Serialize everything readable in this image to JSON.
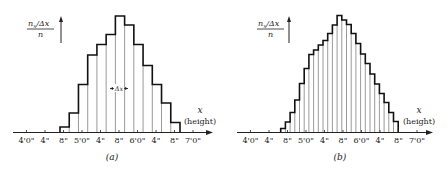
{
  "chart_data": [
    {
      "type": "bar",
      "panel": "(a)",
      "title": "",
      "caption": "(a)",
      "xlabel": "x (height)",
      "ylabel": "n_x/Δx / n",
      "annotation": "Δx",
      "bin_width_inches": 2,
      "categories": [
        "4'8\"",
        "4'10\"",
        "5'0\"",
        "5'2\"",
        "5'4\"",
        "5'6\"",
        "5'8\"",
        "5'10\"",
        "6'0\"",
        "6'2\"",
        "6'4\"",
        "6'6\"",
        "6'8\""
      ],
      "values": [
        5.5,
        19.5,
        48,
        77.5,
        88,
        98,
        116.5,
        107.5,
        88,
        67,
        48,
        29.5,
        10
      ],
      "tick_labels": [
        "4'0\"",
        "4\"",
        "8\"",
        "5'0\"",
        "4\"",
        "8\"",
        "6'0\"",
        "4\"",
        "8\"",
        "7'0\""
      ],
      "grid": false
    },
    {
      "type": "bar",
      "panel": "(b)",
      "title": "",
      "caption": "(b)",
      "xlabel": "x (height)",
      "ylabel": "n_x/Δx / n",
      "bin_width_inches": 1,
      "categories": [
        "4'7\"",
        "4'8\"",
        "4'9\"",
        "4'10\"",
        "4'11\"",
        "5'0\"",
        "5'1\"",
        "5'2\"",
        "5'3\"",
        "5'4\"",
        "5'5\"",
        "5'6\"",
        "5'7\"",
        "5'8\"",
        "5'9\"",
        "5'10\"",
        "5'11\"",
        "6'0\"",
        "6'1\"",
        "6'2\"",
        "6'3\"",
        "6'4\"",
        "6'5\"",
        "6'6\"",
        "6'7\""
      ],
      "values": [
        4,
        10.5,
        20,
        32.5,
        49,
        64,
        78,
        82.5,
        87.5,
        92,
        99,
        107.5,
        117,
        112.5,
        108,
        99,
        89,
        78.5,
        69,
        58.5,
        48.5,
        39,
        30,
        20,
        11
      ],
      "tick_labels": [
        "4'0\"",
        "4\"",
        "8\"",
        "5'0\"",
        "4\"",
        "8\"",
        "6'0\"",
        "4\"",
        "8\"",
        "7'0\""
      ],
      "grid": false
    }
  ],
  "panels": [
    {
      "caption": "(a)",
      "y_num": "n",
      "y_num_sub": "x",
      "y_num_rest": "/Δx",
      "y_den": "n",
      "x_var": "x",
      "x_desc": "(height)",
      "delta": "Δx"
    },
    {
      "caption": "(b)",
      "y_num": "n",
      "y_num_sub": "x",
      "y_num_rest": "/Δx",
      "y_den": "n",
      "x_var": "x",
      "x_desc": "(height)"
    }
  ],
  "ticks": [
    "4'0\"",
    "4\"",
    "8\"",
    "5'0\"",
    "4\"",
    "8\"",
    "6'0\"",
    "4\"",
    "8\"",
    "7'0\""
  ]
}
